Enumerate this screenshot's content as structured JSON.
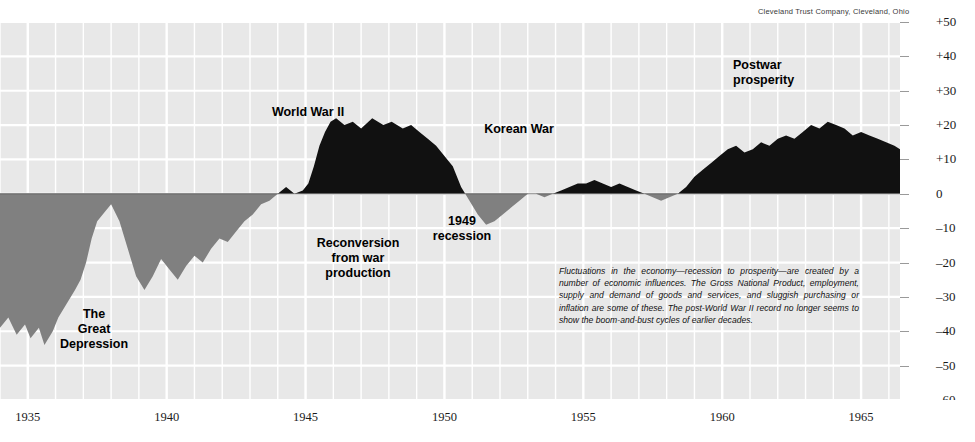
{
  "credit": "Cleveland Trust Company, Cleveland, Ohio",
  "axes": {
    "y_ticks": [
      "+50",
      "+40",
      "+30",
      "+20",
      "+10",
      "0",
      "–10",
      "–20",
      "–30",
      "–40",
      "–50",
      "–60"
    ],
    "y_values": [
      50,
      40,
      30,
      20,
      10,
      0,
      -10,
      -20,
      -30,
      -40,
      -50,
      -60
    ],
    "x_ticks": [
      "1935",
      "1940",
      "1945",
      "1950",
      "1955",
      "1960",
      "1965"
    ],
    "x_values": [
      1935,
      1940,
      1945,
      1950,
      1955,
      1960,
      1965
    ]
  },
  "annotations": [
    {
      "id": "great-depression",
      "text": "The\nGreat\nDepression",
      "x": 94,
      "y": 307,
      "align": "centered"
    },
    {
      "id": "world-war-ii",
      "text": "World  War II",
      "x": 308,
      "y": 105,
      "align": "centered"
    },
    {
      "id": "reconversion",
      "text": "Reconversion\nfrom war\nproduction",
      "x": 358,
      "y": 236,
      "align": "centered"
    },
    {
      "id": "recession-1949",
      "text": "1949\nrecession",
      "x": 462,
      "y": 214,
      "align": "centered"
    },
    {
      "id": "korean-war",
      "text": "Korean  War",
      "x": 519,
      "y": 122,
      "align": "centered"
    },
    {
      "id": "postwar-prosperity",
      "text": "Postwar\nprosperity",
      "x": 733,
      "y": 58,
      "align": "left"
    }
  ],
  "note": "Fluctuations in the economy—recession to prosperity—are created by a number of economic influences. The Gross National Product, employment, supply and demand of goods and services, and sluggish purchasing or inflation are some of these. The post-World War II record no longer seems to show the boom-and-bust cycles of earlier decades.",
  "colors": {
    "plot_background": "#e8e8e8",
    "gridline": "#ffffff",
    "positive_fill": "#111111",
    "negative_fill": "#808080",
    "page_background": "#ffffff",
    "text": "#1a1a1a"
  },
  "chart_data": {
    "type": "area",
    "title": "",
    "subtitle": "",
    "xlabel": "",
    "ylabel": "",
    "xlim": [
      1934.0,
      1966.4
    ],
    "ylim": [
      -60,
      50
    ],
    "grid": true,
    "legend": false,
    "zero_baseline": 0,
    "series": [
      {
        "name": "Business activity deviation from trend (percent)",
        "x": [
          1934.0,
          1934.3,
          1934.6,
          1934.9,
          1935.1,
          1935.4,
          1935.6,
          1935.9,
          1936.1,
          1936.4,
          1936.7,
          1936.9,
          1937.1,
          1937.3,
          1937.5,
          1937.8,
          1938.0,
          1938.3,
          1938.6,
          1938.9,
          1939.2,
          1939.5,
          1939.8,
          1940.1,
          1940.4,
          1940.7,
          1941.0,
          1941.3,
          1941.6,
          1941.9,
          1942.2,
          1942.5,
          1942.8,
          1943.1,
          1943.4,
          1943.7,
          1944.0,
          1944.3,
          1944.6,
          1944.9,
          1945.1,
          1945.3,
          1945.5,
          1945.7,
          1945.9,
          1946.1,
          1946.4,
          1946.7,
          1947.0,
          1947.4,
          1947.8,
          1948.1,
          1948.5,
          1948.8,
          1949.1,
          1949.4,
          1949.7,
          1950.0,
          1950.3,
          1950.6,
          1950.9,
          1951.2,
          1951.5,
          1951.8,
          1952.1,
          1952.4,
          1952.7,
          1953.0,
          1953.3,
          1953.6,
          1953.9,
          1954.2,
          1954.5,
          1954.8,
          1955.1,
          1955.4,
          1955.7,
          1956.0,
          1956.3,
          1956.6,
          1956.9,
          1957.2,
          1957.5,
          1957.8,
          1958.1,
          1958.4,
          1958.7,
          1959.0,
          1959.3,
          1959.6,
          1959.9,
          1960.2,
          1960.5,
          1960.8,
          1961.1,
          1961.4,
          1961.7,
          1962.0,
          1962.3,
          1962.6,
          1962.9,
          1963.2,
          1963.5,
          1963.8,
          1964.1,
          1964.4,
          1964.7,
          1965.0,
          1965.3,
          1965.6,
          1965.9,
          1966.2,
          1966.4
        ],
        "y": [
          -39,
          -36,
          -41,
          -38,
          -42,
          -39,
          -44,
          -40,
          -36,
          -32,
          -28,
          -25,
          -20,
          -13,
          -8,
          -5,
          -3,
          -8,
          -16,
          -24,
          -28,
          -24,
          -19,
          -22,
          -25,
          -21,
          -18,
          -20,
          -16,
          -13,
          -14,
          -11,
          -8,
          -6,
          -3,
          -2,
          0,
          2,
          0,
          1,
          3,
          8,
          14,
          18,
          21,
          22,
          20,
          21,
          19,
          22,
          20,
          21,
          19,
          20,
          18,
          16,
          14,
          11,
          8,
          2,
          -2,
          -6,
          -9,
          -8,
          -6,
          -4,
          -2,
          0,
          0,
          -1,
          0,
          1,
          2,
          3,
          3,
          4,
          3,
          2,
          3,
          2,
          1,
          0,
          -1,
          -2,
          -1,
          0,
          2,
          5,
          7,
          9,
          11,
          13,
          14,
          12,
          13,
          15,
          14,
          16,
          17,
          16,
          18,
          20,
          19,
          21,
          20,
          19,
          17,
          18,
          17,
          16,
          15,
          14,
          13
        ]
      }
    ]
  }
}
